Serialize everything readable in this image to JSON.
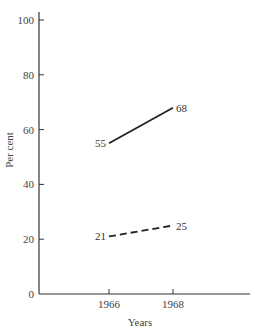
{
  "chart_data": {
    "type": "line",
    "title": "",
    "xlabel": "Years",
    "ylabel": "Per cent",
    "ylim": [
      0,
      100
    ],
    "yticks": [
      0,
      20,
      40,
      60,
      80,
      100
    ],
    "x": [
      "1966",
      "1968"
    ],
    "grid": false,
    "legend": null,
    "series": [
      {
        "name": "upper series (solid)",
        "style": "solid",
        "values": [
          55,
          68
        ]
      },
      {
        "name": "lower series (dashed)",
        "style": "dashed",
        "values": [
          21,
          25
        ]
      }
    ]
  },
  "colors": {
    "line": "#222222",
    "axis": "#333333",
    "background": "#ffffff"
  }
}
